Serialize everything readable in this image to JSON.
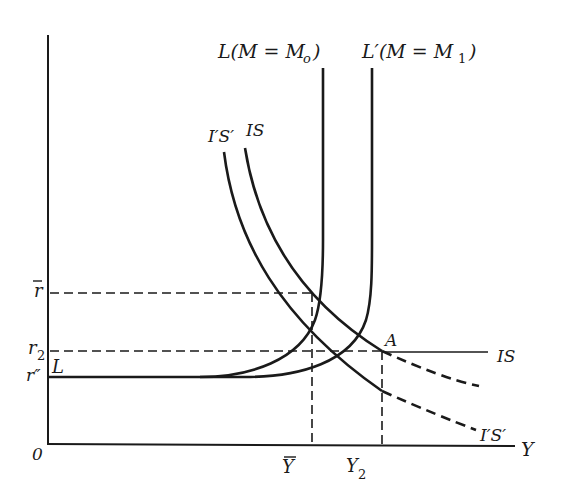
{
  "diagram": {
    "type": "IS-LM diagram",
    "axes": {
      "origin_label": "0",
      "x_label": "Y",
      "y_ticks": [
        {
          "id": "r_bar",
          "label": "r",
          "overline": true
        },
        {
          "id": "r2",
          "label": "r",
          "subscript": "2"
        },
        {
          "id": "r_dprime",
          "label": "r″"
        }
      ],
      "x_ticks": [
        {
          "id": "y_bar",
          "label": "Y",
          "overline": true
        },
        {
          "id": "y2",
          "label": "Y",
          "subscript": "2"
        }
      ]
    },
    "curves": {
      "L": {
        "label_top": "L(M = M",
        "label_top_sub": "o",
        "label_top_close": ")",
        "label_bottom": "L"
      },
      "L_prime": {
        "label_top": "L′(M = M",
        "label_top_sub": "1",
        "label_top_close": ")"
      },
      "IS_top_label": "IS",
      "IpSp_top_label": "I′S′",
      "IS_horizontal_label": "IS",
      "IpSp_bottom_label": "I′S′"
    },
    "points": {
      "A": "A"
    }
  }
}
